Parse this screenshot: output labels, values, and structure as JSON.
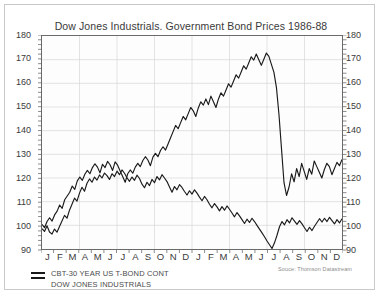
{
  "chart_data": {
    "type": "line",
    "title": "Dow Jones Industrials. Government Bond Prices 1986-88",
    "xlabel": "",
    "ylabel": "",
    "ylim": [
      90,
      180
    ],
    "yticks": [
      90,
      100,
      110,
      120,
      130,
      140,
      150,
      160,
      170,
      180
    ],
    "grid": true,
    "legend_position": "below-left",
    "source": "Souce: Thomson Datastream",
    "x_tick_labels": [
      "J",
      "F",
      "M",
      "A",
      "M",
      "J",
      "J",
      "A",
      "S",
      "O",
      "N",
      "D",
      "J",
      "F",
      "M",
      "A",
      "M",
      "J",
      "J",
      "A",
      "S",
      "O",
      "N",
      "D"
    ],
    "x_range_description": "1986-88",
    "series": [
      {
        "name": "CBT-30 YEAR US T-BOND CONT",
        "color": "#1a1a1a",
        "values": [
          98.6,
          97.4,
          99.8,
          97.2,
          96.3,
          98.4,
          97.1,
          99.5,
          101.8,
          104.2,
          103.0,
          106.4,
          108.9,
          111.5,
          110.2,
          113.6,
          116.1,
          114.4,
          117.8,
          119.6,
          118.2,
          120.4,
          119.1,
          121.3,
          120.0,
          122.1,
          121.0,
          119.4,
          121.8,
          120.6,
          122.9,
          121.4,
          123.4,
          122.0,
          120.1,
          118.6,
          120.4,
          119.0,
          121.2,
          119.8,
          117.4,
          115.9,
          118.2,
          116.8,
          119.4,
          118.0,
          120.6,
          119.2,
          121.4,
          120.0,
          118.5,
          116.2,
          114.0,
          116.4,
          115.0,
          117.2,
          116.0,
          114.3,
          112.8,
          114.6,
          113.2,
          115.0,
          113.6,
          111.9,
          110.4,
          112.2,
          110.8,
          108.9,
          107.4,
          109.2,
          107.8,
          106.1,
          107.9,
          106.4,
          108.2,
          106.8,
          105.2,
          103.6,
          105.4,
          104.0,
          102.4,
          100.8,
          102.6,
          101.2,
          103.0,
          101.6,
          100.0,
          98.4,
          96.8,
          95.2,
          93.4,
          91.8,
          90.2,
          92.6,
          95.8,
          99.4,
          101.6,
          100.2,
          102.4,
          101.0,
          103.2,
          101.8,
          100.4,
          102.0,
          100.6,
          99.0,
          97.4,
          99.2,
          97.8,
          99.6,
          101.2,
          102.8,
          101.4,
          103.0,
          101.6,
          103.4,
          102.0,
          100.6,
          102.4,
          101.0,
          102.8
        ]
      },
      {
        "name": "DOW JONES INDUSTRIALS",
        "color": "#1a1a1a",
        "values": [
          100.4,
          99.0,
          101.6,
          103.2,
          101.8,
          104.4,
          106.0,
          108.6,
          107.2,
          110.8,
          112.4,
          114.0,
          116.6,
          115.2,
          118.8,
          120.4,
          119.0,
          121.6,
          123.2,
          121.8,
          124.4,
          126.0,
          124.6,
          122.2,
          125.8,
          124.4,
          127.0,
          125.6,
          123.2,
          126.8,
          125.4,
          123.0,
          120.6,
          118.2,
          121.8,
          123.4,
          122.0,
          124.6,
          126.2,
          124.8,
          127.4,
          129.0,
          127.6,
          125.2,
          128.8,
          130.4,
          129.0,
          131.6,
          133.2,
          131.8,
          134.4,
          137.0,
          139.6,
          142.2,
          140.8,
          143.4,
          146.0,
          144.6,
          147.2,
          149.8,
          148.4,
          146.0,
          149.6,
          152.2,
          150.8,
          153.4,
          151.0,
          154.6,
          152.2,
          149.8,
          153.4,
          156.0,
          154.6,
          157.2,
          159.8,
          158.4,
          161.0,
          163.6,
          162.2,
          164.8,
          167.4,
          166.0,
          168.6,
          171.2,
          169.8,
          172.4,
          170.0,
          167.6,
          170.2,
          172.8,
          171.4,
          168.0,
          164.6,
          158.2,
          146.8,
          132.4,
          118.0,
          112.6,
          116.2,
          121.8,
          118.4,
          124.0,
          120.6,
          126.2,
          122.8,
          119.4,
          124.0,
          121.6,
          127.2,
          124.8,
          122.4,
          120.0,
          123.6,
          126.2,
          124.8,
          121.4,
          124.0,
          126.6,
          125.2,
          127.8
        ]
      }
    ]
  },
  "legend": {
    "items": [
      "CBT-30 YEAR US T-BOND CONT",
      "DOW JONES INDUSTRIALS"
    ]
  }
}
